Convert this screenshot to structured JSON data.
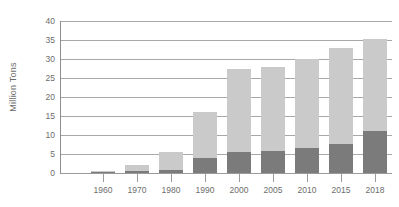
{
  "chart_data": {
    "type": "bar",
    "title": "",
    "subtitle": "",
    "xlabel": "",
    "ylabel": "Million Tons",
    "stacked": true,
    "grid": true,
    "legend": "none",
    "ylim": [
      0,
      40
    ],
    "ytick_step": 5,
    "yticks": [
      "40",
      "35",
      "30",
      "25",
      "20",
      "15",
      "10",
      "5",
      "0"
    ],
    "categories": [
      "1960",
      "1970",
      "1980",
      "1990",
      "2000",
      "2005",
      "2010",
      "2015",
      "2018"
    ],
    "series": [
      {
        "name": "lower-segment",
        "color": "#7b7b7b",
        "values": [
          0.2,
          0.4,
          0.8,
          4.0,
          5.5,
          5.8,
          6.5,
          7.6,
          11.0
        ]
      },
      {
        "name": "upper-segment",
        "color": "#cacaca",
        "values": [
          0.3,
          1.6,
          4.7,
          12.0,
          21.9,
          22.2,
          23.5,
          25.4,
          24.3
        ]
      }
    ],
    "totals": [
      0.5,
      2.0,
      5.5,
      16.0,
      27.4,
      28.0,
      30.0,
      33.0,
      35.3
    ]
  },
  "colors": {
    "background": "#ffffff",
    "gridline": "#a8a8a8",
    "axis_line": "#8f8f8f",
    "tick_text": "#6d6d6d",
    "bar_light": "#cacaca",
    "bar_dark": "#7b7b7b"
  }
}
